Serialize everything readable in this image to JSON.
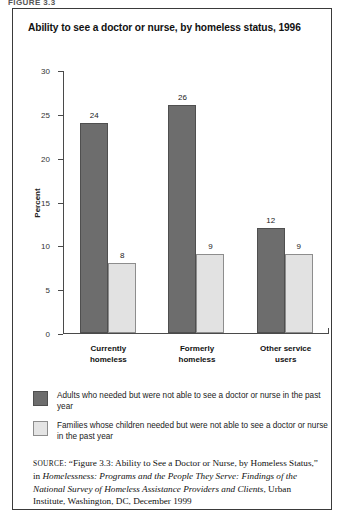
{
  "figure_caption": "FIGURE 3.3",
  "chart_title": "Ability to see a doctor or nurse, by homeless status, 1996",
  "axis": {
    "ylabel": "Percent",
    "ticks": [
      "30",
      "25",
      "20",
      "15",
      "10",
      "5",
      "0"
    ]
  },
  "legend": {
    "items": [
      {
        "swatch": "dark",
        "label": "Adults who needed but were not able to see a doctor or nurse in the past year"
      },
      {
        "swatch": "light",
        "label": "Families whose children needed but were not able to see a doctor or nurse in the past year"
      }
    ]
  },
  "source": {
    "label": "SOURCE",
    "part1": ": “Figure 3.3: Ability to See a Doctor or Nurse, by Homeless Status,” in ",
    "title_italic": "Homelessness: Programs and the People They Serve: Findings of the National Survey of Homeless Assistance Providers and Clients",
    "part2": ", Urban Institute, Washington, DC, December 1999"
  },
  "colors": {
    "dark_bar": "#6d6d6d",
    "light_bar": "#e2e2e2",
    "axis": "#4a4a4a",
    "border": "#3a3a3a"
  },
  "chart_data": {
    "type": "bar",
    "title": "Ability to see a doctor or nurse, by homeless status, 1996",
    "xlabel": "",
    "ylabel": "Percent",
    "ylim": [
      0,
      30
    ],
    "ytick_interval": 5,
    "grid": false,
    "legend_position": "below",
    "categories": [
      "Currently homeless",
      "Formerly homeless",
      "Other service users"
    ],
    "category_lines": [
      [
        "Currently",
        "homeless"
      ],
      [
        "Formerly",
        "homeless"
      ],
      [
        "Other service",
        "users"
      ]
    ],
    "series": [
      {
        "name": "Adults who needed but were not able to see a doctor or nurse in the past year",
        "color": "#6d6d6d",
        "values": [
          24,
          26,
          12
        ]
      },
      {
        "name": "Families whose children needed but were not able to see a doctor or nurse in the past year",
        "color": "#e2e2e2",
        "values": [
          8,
          9,
          9
        ]
      }
    ]
  }
}
